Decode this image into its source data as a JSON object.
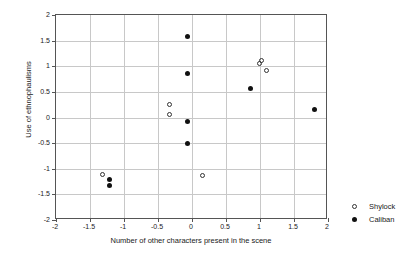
{
  "chart_data": {
    "type": "scatter",
    "title": "",
    "xlabel": "Number of other characters present in the scene",
    "ylabel": "Use of ethnophaulisms",
    "xlim": [
      -2,
      2
    ],
    "ylim": [
      -2,
      2
    ],
    "xticks": [
      -2,
      -1.5,
      -1,
      -0.5,
      0,
      0.5,
      1,
      1.5,
      2
    ],
    "yticks": [
      -2,
      -1.5,
      -1,
      -0.5,
      0,
      0.5,
      1,
      1.5,
      2
    ],
    "xticklabels": [
      "-2",
      "-1.5",
      "-1",
      "-0.5",
      "0",
      "0.5",
      "1",
      "1.5",
      "2"
    ],
    "yticklabels": [
      "-2",
      "-1.5",
      "-1",
      "-0.5",
      "0",
      "0.5",
      "1",
      "1.5",
      "2"
    ],
    "grid": true,
    "legend_position": "right-outside",
    "series": [
      {
        "name": "Shylock",
        "marker": "open-circle",
        "color": "#333333",
        "points": [
          {
            "x": -1.32,
            "y": -1.11
          },
          {
            "x": -0.33,
            "y": 0.26
          },
          {
            "x": -0.33,
            "y": 0.05
          },
          {
            "x": 0.16,
            "y": -1.13
          },
          {
            "x": 0.99,
            "y": 1.06
          },
          {
            "x": 1.02,
            "y": 1.11
          },
          {
            "x": 1.09,
            "y": 0.92
          }
        ]
      },
      {
        "name": "Caliban",
        "marker": "filled-circle",
        "color": "#111111",
        "points": [
          {
            "x": -1.22,
            "y": -1.2
          },
          {
            "x": -1.22,
            "y": -1.32
          },
          {
            "x": -0.06,
            "y": 1.59
          },
          {
            "x": -0.06,
            "y": 0.85
          },
          {
            "x": -0.06,
            "y": -0.07
          },
          {
            "x": -0.06,
            "y": -0.51
          },
          {
            "x": 0.86,
            "y": 0.57
          },
          {
            "x": 1.8,
            "y": 0.16
          }
        ]
      }
    ]
  },
  "legend": {
    "entries": [
      {
        "label": "Shylock",
        "marker": "open-circle"
      },
      {
        "label": "Caliban",
        "marker": "filled-circle"
      }
    ]
  }
}
